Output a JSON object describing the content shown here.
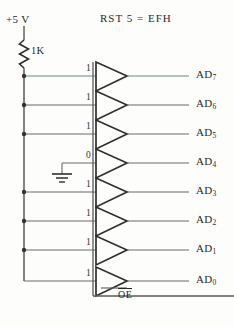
{
  "diagram": {
    "title": "RST 5  =  EFH",
    "supply_label": "+5 V",
    "resistor_label": "1K",
    "enable_label": "OE",
    "ground_name": "ground-symbol",
    "rows": [
      {
        "bit": "1",
        "output": "AD",
        "index": "7"
      },
      {
        "bit": "1",
        "output": "AD",
        "index": "6"
      },
      {
        "bit": "1",
        "output": "AD",
        "index": "5"
      },
      {
        "bit": "0",
        "output": "AD",
        "index": "4"
      },
      {
        "bit": "1",
        "output": "AD",
        "index": "3"
      },
      {
        "bit": "1",
        "output": "AD",
        "index": "2"
      },
      {
        "bit": "1",
        "output": "AD",
        "index": "1"
      },
      {
        "bit": "1",
        "output": "AD",
        "index": "0"
      }
    ],
    "colors": {
      "wire": "#4a4a4a",
      "ink": "#2a2a2a",
      "highlight": "#5d8d86",
      "background": "#fdfdfb"
    }
  }
}
